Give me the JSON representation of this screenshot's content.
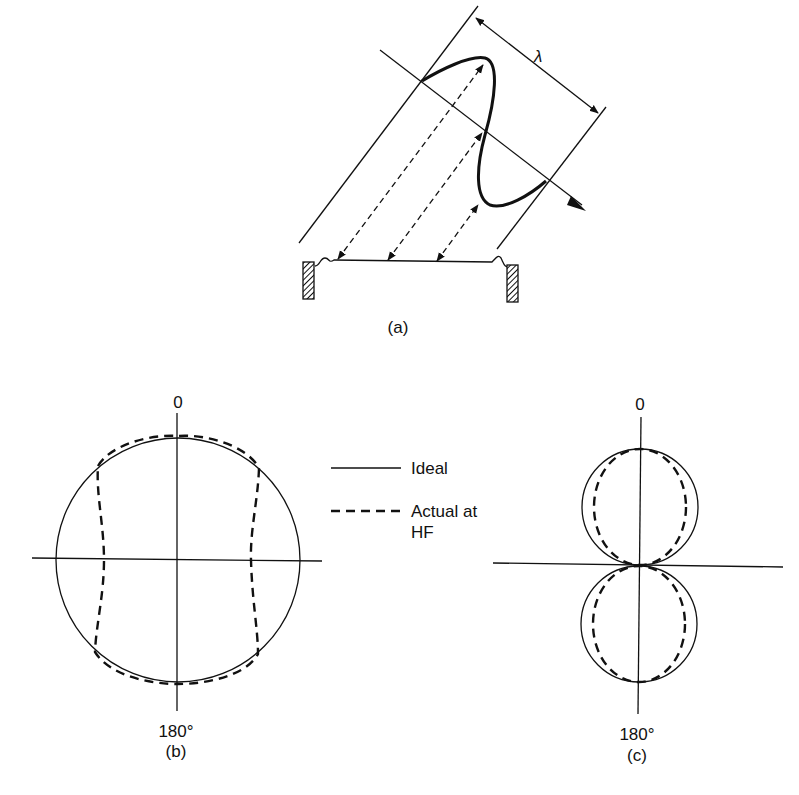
{
  "figure": {
    "panel_a": {
      "label": "(a)",
      "dimension_label": "λ",
      "description": "Sound wave of wavelength λ arriving obliquely at a ribbon diaphragm between two pole pieces"
    },
    "panel_b": {
      "top_label": "0",
      "bottom_label": "180°",
      "label": "(b)",
      "description": "Omnidirectional (circular) polar pattern"
    },
    "panel_c": {
      "top_label": "0",
      "bottom_label": "180°",
      "label": "(c)",
      "description": "Figure-of-eight polar pattern"
    },
    "legend": {
      "items": [
        {
          "style": "solid",
          "label": "Ideal"
        },
        {
          "style": "dashed",
          "label_line1": "Actual at",
          "label_line2": "HF"
        }
      ]
    }
  }
}
